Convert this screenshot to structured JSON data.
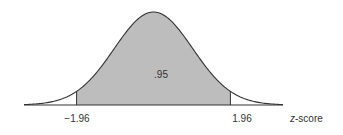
{
  "chart_data": {
    "type": "area",
    "title": "",
    "xlabel": "z-score",
    "ylabel": "",
    "distribution": "standard normal",
    "x_range": [
      -3.3,
      3.3
    ],
    "shaded_region": {
      "from": -1.96,
      "to": 1.96,
      "area": 0.95
    },
    "tick_labels": [
      "-1.96",
      "1.96"
    ],
    "annotation": ".95",
    "grid": false,
    "colors": {
      "shade": "#bdbdbd",
      "curve": "#333333",
      "background": "#ffffff"
    }
  },
  "labels": {
    "left_tick": "−1.96",
    "right_tick": "1.96",
    "area": ".95",
    "axis_z": "z",
    "axis_rest": "-score"
  }
}
